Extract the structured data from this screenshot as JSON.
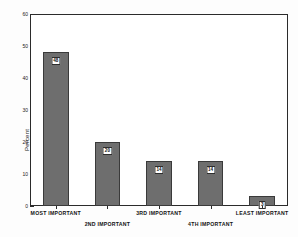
{
  "chart_data": {
    "type": "bar",
    "title": "",
    "xlabel": "",
    "ylabel": "Percent",
    "ylim": [
      0,
      60
    ],
    "ytick_values": [
      0,
      10,
      20,
      30,
      40,
      50,
      60
    ],
    "ytick_labels": [
      "0",
      "10",
      "20",
      "30",
      "40",
      "50",
      "60"
    ],
    "grid": false,
    "legend": "none",
    "categories": [
      "MOST IMPORTANT",
      "2ND IMPORTANT",
      "3RD IMPORTANT",
      "4TH IMPORTANT",
      "LEAST IMPORTANT"
    ],
    "values": [
      48,
      20,
      14,
      14,
      3
    ],
    "value_labels": [
      "48",
      "20",
      "14",
      "14",
      "3"
    ],
    "bar_color": "#6e6e6e",
    "bar_edge_color": "#3a3a3a",
    "frame_color": "#2b2b2b",
    "background_color": "#ffffff"
  }
}
